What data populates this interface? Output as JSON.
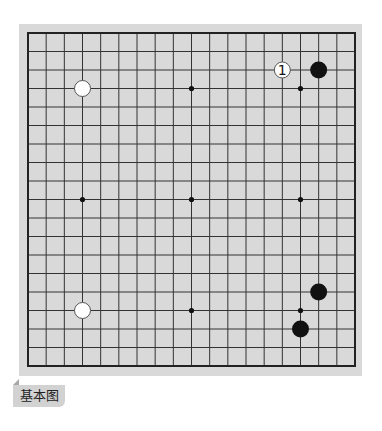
{
  "diagram": {
    "caption": "基本图",
    "board_size": 19,
    "colors": {
      "board_bg": "#d9d9d9",
      "line": "#333333",
      "border": "#222222",
      "black_stone": "#111111",
      "white_stone": "#ffffff",
      "white_stone_stroke": "#555555",
      "star": "#111111"
    },
    "star_points": [
      [
        3,
        3
      ],
      [
        9,
        3
      ],
      [
        15,
        3
      ],
      [
        3,
        9
      ],
      [
        9,
        9
      ],
      [
        15,
        9
      ],
      [
        3,
        15
      ],
      [
        9,
        15
      ],
      [
        15,
        15
      ]
    ],
    "stones": [
      {
        "color": "white",
        "col": 3,
        "row": 3,
        "label": ""
      },
      {
        "color": "white",
        "col": 14,
        "row": 2,
        "label": "1"
      },
      {
        "color": "black",
        "col": 16,
        "row": 2,
        "label": ""
      },
      {
        "color": "white",
        "col": 3,
        "row": 15,
        "label": ""
      },
      {
        "color": "black",
        "col": 16,
        "row": 14,
        "label": ""
      },
      {
        "color": "black",
        "col": 15,
        "row": 16,
        "label": ""
      }
    ]
  }
}
